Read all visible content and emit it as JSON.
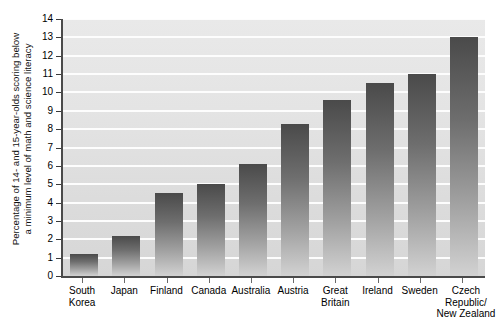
{
  "chart_data": {
    "type": "bar",
    "title": "",
    "subtitle": "",
    "xlabel": "",
    "ylabel": "Percentage of 14- and 15-year-olds scoring below a minimum level of math and science literacy",
    "ylabel_lines": [
      "Percentage of 14- and 15-year-olds scoring below",
      "a minimum level of math and science literacy"
    ],
    "categories": [
      "South Korea",
      "Japan",
      "Finland",
      "Canada",
      "Australia",
      "Austria",
      "Great Britain",
      "Ireland",
      "Sweden",
      "Czech Republic/ New Zealand"
    ],
    "category_lines": [
      [
        "South",
        "Korea"
      ],
      [
        "Japan"
      ],
      [
        "Finland"
      ],
      [
        "Canada"
      ],
      [
        "Australia"
      ],
      [
        "Austria"
      ],
      [
        "Great",
        "Britain"
      ],
      [
        "Ireland"
      ],
      [
        "Sweden"
      ],
      [
        "Czech",
        "Republic/",
        "New Zealand"
      ]
    ],
    "values": [
      1.2,
      2.2,
      4.5,
      5.0,
      6.1,
      8.3,
      9.6,
      10.5,
      11.0,
      13.0
    ],
    "ylim": [
      0,
      14
    ],
    "ytick_labels": [
      "0",
      "1",
      "2",
      "3",
      "4",
      "5",
      "6",
      "7",
      "8",
      "9",
      "10",
      "11",
      "12",
      "13",
      "14"
    ],
    "yticks": [
      0,
      1,
      2,
      3,
      4,
      5,
      6,
      7,
      8,
      9,
      10,
      11,
      12,
      13,
      14
    ],
    "grid": true,
    "grid_color": "#fdfdfd",
    "legend": "none",
    "plot_background": "#e2e2e2",
    "bar_gradient_top": "#4a4a4a",
    "bar_gradient_bottom": "#d2d2d2",
    "axis_color": "#4a4a4a"
  }
}
